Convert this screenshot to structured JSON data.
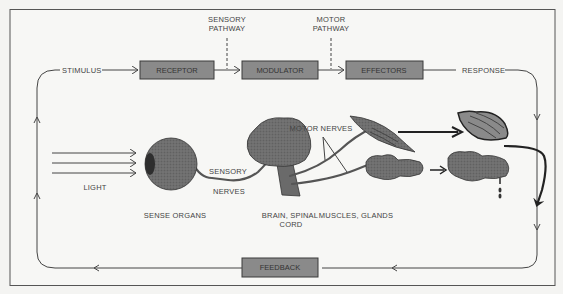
{
  "flow": {
    "stimulus": "STIMULUS",
    "response": "RESPONSE",
    "sensory_pathway": [
      "SENSORY",
      "PATHWAY"
    ],
    "motor_pathway": [
      "MOTOR",
      "PATHWAY"
    ]
  },
  "boxes": {
    "receptor": "RECEPTOR",
    "modulator": "MODULATOR",
    "effectors": "EFFECTORS",
    "feedback": "FEEDBACK"
  },
  "illustration": {
    "light": "LIGHT",
    "sensory_nerves": [
      "SENSORY",
      "NERVES"
    ],
    "motor_nerves": "MOTOR NERVES",
    "sense_organs": "SENSE ORGANS",
    "brain_spinal_cord": [
      "BRAIN, SPINAL",
      "CORD"
    ],
    "muscles_glands": "MUSCLES, GLANDS"
  },
  "colors": {
    "box_fill": "#8a8a8a",
    "line": "#444444",
    "background": "#f4f4f2"
  }
}
